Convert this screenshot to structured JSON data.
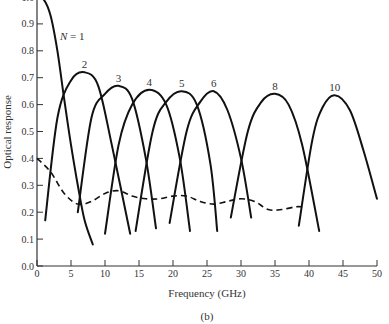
{
  "chart_data": {
    "type": "line",
    "title": "",
    "caption": "(b)",
    "xlabel": "Frequency (GHz)",
    "ylabel": "Optical response",
    "xlim": [
      0,
      50
    ],
    "ylim": [
      0,
      1.0
    ],
    "xticks": [
      "0",
      "5",
      "10",
      "15",
      "20",
      "25",
      "30",
      "35",
      "40",
      "45",
      "50"
    ],
    "yticks": [
      "0.0",
      "0.1",
      "0.2",
      "0.3",
      "0.4",
      "0.5",
      "0.6",
      "0.7",
      "0.8",
      "0.9",
      "1.0"
    ],
    "grid": false,
    "legend": "inline labels",
    "series": [
      {
        "name": "N = 1",
        "label": "N = 1",
        "style": "solid",
        "peak": [
          0,
          1.0
        ],
        "x": [
          0,
          1,
          2,
          3,
          4,
          5,
          6,
          7,
          8.2
        ],
        "y": [
          1.0,
          0.99,
          0.93,
          0.8,
          0.62,
          0.45,
          0.3,
          0.17,
          0.08
        ]
      },
      {
        "name": "N = 2",
        "label": "2",
        "style": "solid",
        "peak": [
          7,
          0.72
        ],
        "x": [
          1.2,
          3,
          5,
          7,
          9,
          11,
          13.7
        ],
        "y": [
          0.17,
          0.55,
          0.69,
          0.72,
          0.67,
          0.45,
          0.12
        ]
      },
      {
        "name": "N = 3",
        "label": "3",
        "style": "solid",
        "peak": [
          12,
          0.67
        ],
        "x": [
          6,
          8,
          10,
          12,
          14,
          16,
          17.5
        ],
        "y": [
          0.2,
          0.55,
          0.64,
          0.67,
          0.62,
          0.4,
          0.14
        ]
      },
      {
        "name": "N = 4",
        "label": "4",
        "style": "solid",
        "peak": [
          16.5,
          0.655
        ],
        "x": [
          10,
          12,
          14,
          16.5,
          19,
          21,
          22.5
        ],
        "y": [
          0.12,
          0.45,
          0.6,
          0.655,
          0.6,
          0.4,
          0.13
        ]
      },
      {
        "name": "N = 5",
        "label": "5",
        "style": "solid",
        "peak": [
          21.3,
          0.65
        ],
        "x": [
          14.5,
          17,
          19,
          21.3,
          23.5,
          25.5,
          26.5
        ],
        "y": [
          0.13,
          0.5,
          0.61,
          0.65,
          0.6,
          0.38,
          0.13
        ]
      },
      {
        "name": "N = 6",
        "label": "6",
        "style": "solid",
        "peak": [
          26,
          0.65
        ],
        "x": [
          19.5,
          22,
          24,
          26,
          28,
          30,
          31.5
        ],
        "y": [
          0.16,
          0.5,
          0.61,
          0.65,
          0.58,
          0.4,
          0.18
        ]
      },
      {
        "name": "N = 8",
        "label": "8",
        "style": "solid",
        "peak": [
          35,
          0.64
        ],
        "x": [
          28.5,
          31,
          33,
          35,
          37,
          39,
          41.5
        ],
        "y": [
          0.18,
          0.5,
          0.61,
          0.64,
          0.6,
          0.45,
          0.13
        ]
      },
      {
        "name": "N = 10",
        "label": "10",
        "style": "solid",
        "peak": [
          43.8,
          0.635
        ],
        "x": [
          38.5,
          40.5,
          42,
          43.8,
          46,
          48,
          50
        ],
        "y": [
          0.15,
          0.47,
          0.59,
          0.635,
          0.58,
          0.43,
          0.25
        ]
      },
      {
        "name": "envelope",
        "label": "",
        "style": "dashed",
        "x": [
          0,
          2,
          4,
          6,
          8,
          10,
          12,
          14,
          16,
          18,
          20,
          22,
          24,
          26,
          28,
          30,
          32,
          34,
          36,
          38,
          39
        ],
        "y": [
          0.4,
          0.35,
          0.27,
          0.23,
          0.24,
          0.27,
          0.28,
          0.26,
          0.25,
          0.25,
          0.26,
          0.26,
          0.24,
          0.23,
          0.24,
          0.25,
          0.24,
          0.21,
          0.21,
          0.22,
          0.22
        ]
      }
    ]
  }
}
